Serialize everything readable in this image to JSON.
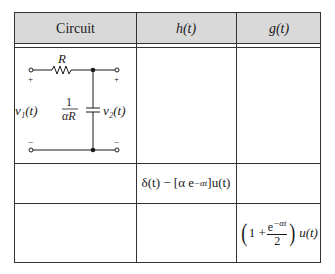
{
  "table": {
    "headers": [
      "Circuit",
      "h(t)",
      "g(t)"
    ],
    "header_bg": "#d9d9d9",
    "rows": [
      {
        "circuit": {
          "resistor_label": "R",
          "capacitor_label_num": "1",
          "capacitor_label_den": "αR",
          "input_label": "v₁(t)",
          "output_label": "v₂(t)",
          "plus": "+",
          "minus": "−"
        },
        "h": "",
        "g": ""
      },
      {
        "circuit": "",
        "h": {
          "text_a": "δ(t) − [α e",
          "sup": "−αt",
          "text_b": "]u(t)"
        },
        "g": ""
      },
      {
        "circuit": "",
        "h": "",
        "g": {
          "lparen": "(",
          "one_plus": "1 + ",
          "num_a": "e",
          "num_sup": "−αt",
          "den": "2",
          "rparen": ")",
          "tail": "u(t)"
        }
      }
    ]
  }
}
